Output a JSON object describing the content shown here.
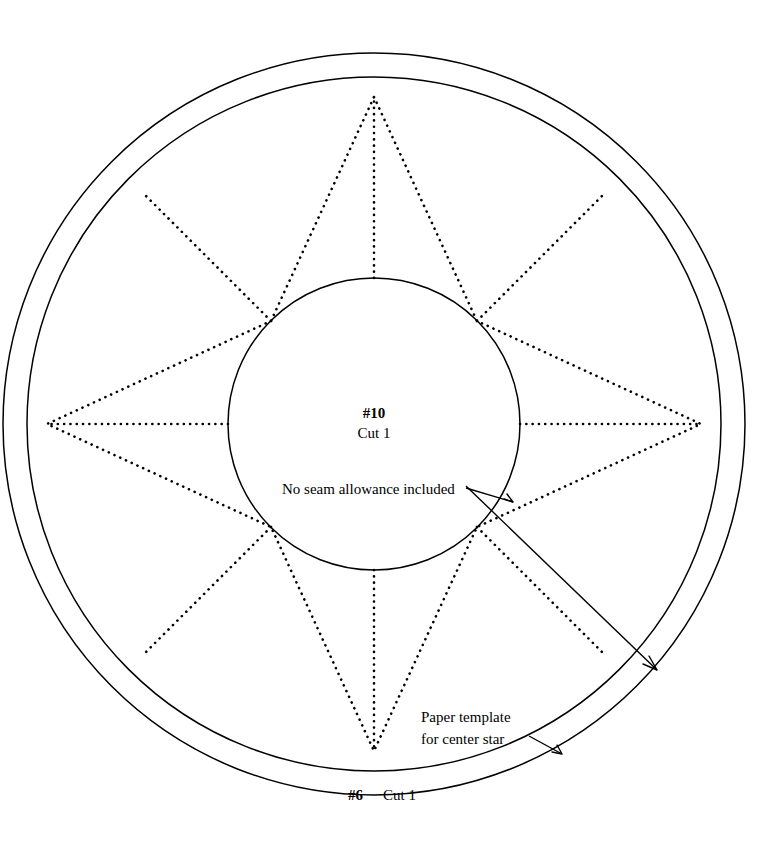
{
  "document": {
    "kind": "quilting-paper-template",
    "background_color": "#ffffff",
    "ink_color": "#000000"
  },
  "labels": {
    "center_piece_number": "#10",
    "center_cut": "Cut 1",
    "seam_note": "No seam allowance included",
    "callout_line1": "Paper template",
    "callout_line2": "for center star",
    "ring_piece_number": "#6",
    "ring_cut": "Cut 1"
  },
  "geometry": {
    "center": {
      "x": 374,
      "y": 424
    },
    "outer_circle_radius": 371,
    "inner_circle_radius": 347,
    "center_circle_radius": 146,
    "star_points": 8,
    "star_outer_radius": 327,
    "star_inner_radius": 146,
    "star_rotation_degrees": -90
  },
  "annotations": [
    {
      "name": "seam-allowance-arrow",
      "from": {
        "x": 466,
        "y": 489
      },
      "to": {
        "x": 510,
        "y": 501
      }
    },
    {
      "name": "ring-pointer-arrow",
      "from": {
        "x": 466,
        "y": 487
      },
      "to": {
        "x": 656,
        "y": 669
      }
    },
    {
      "name": "paper-template-arrow",
      "from": {
        "x": 528,
        "y": 737
      },
      "to": {
        "x": 560,
        "y": 752
      }
    }
  ]
}
